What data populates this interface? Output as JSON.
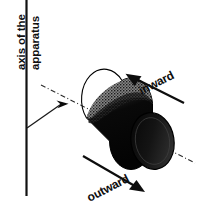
{
  "figure": {
    "background_color": "#ffffff",
    "ink_color": "#101010",
    "width": 197,
    "height": 208
  },
  "axis": {
    "caption_line1": "axis of the",
    "caption_line2": "apparatus",
    "line_name": "apparatus-axis-line",
    "leader_name": "axis-leader-line",
    "marker_name": "axis-intersection-marker",
    "centerline_name": "cylinder-centerline"
  },
  "cylinder": {
    "name": "cylinder-body",
    "body_color": "#0a0a0a",
    "highlight_color": "#6e6e6e",
    "end_face_color": "#1c1c1c",
    "edge_color": "#000000"
  },
  "labels": {
    "inward": "inward",
    "outward": "outward"
  },
  "arrows": {
    "inward_name": "inward-flow-arrow",
    "outward_name": "outward-flow-arrow",
    "inward_direction": "up-left",
    "outward_direction": "down-right"
  }
}
